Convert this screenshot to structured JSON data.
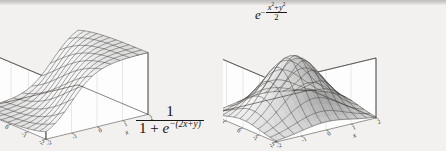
{
  "figure": {
    "background_color": "#f2f1ef",
    "ink_color": "#1b1915",
    "surface_fill_light": "#f4f4f4",
    "surface_fill_dark": "#8a8a8a",
    "mesh_color": "#3c3a37",
    "axis_color": "#35332f"
  },
  "panels": [
    {
      "id": "left",
      "name": "sigmoid-surface-plot",
      "formula_plain": "1 / (1 + e^-(2x+y))",
      "formula": {
        "numerator": "1",
        "den_one": "1",
        "den_plus": "+",
        "den_e": "e",
        "den_exp": "−(2x+y)"
      },
      "chart_data": {
        "type": "surface",
        "title": "",
        "function": "1/(1+exp(-(2x+y)))",
        "xlabel": "x",
        "ylabel": "y",
        "zlabel": "",
        "xlim": [
          -2,
          2
        ],
        "ylim": [
          -2,
          2
        ],
        "zlim": [
          0,
          1
        ],
        "xticks": [
          "-2",
          "-1",
          "0",
          "1",
          "2"
        ],
        "yticks": [
          "-2",
          "-1",
          "0",
          "1",
          "2"
        ],
        "zticks": [
          "1"
        ],
        "grid": true,
        "mesh_n": 11,
        "legend": "none",
        "description": "Logistic sigmoid ridge rising from 0 to 1 along the 2x+y direction"
      },
      "zaxis_top_label": "1",
      "xaxis_label": "x",
      "yaxis_label": "y",
      "xtick_labels": [
        "-2",
        "-1",
        "0",
        "1",
        "2"
      ],
      "ytick_labels": [
        "2",
        "1",
        "0",
        "-1",
        "-2"
      ]
    },
    {
      "id": "right",
      "name": "gaussian-surface-plot",
      "formula_plain": "e^-((x^2+y^2)/2)",
      "formula": {
        "base": "e",
        "minus": "−",
        "num_x": "x",
        "num_x_pow": "2",
        "num_plus": "+",
        "num_y": "y",
        "num_y_pow": "2",
        "den": "2"
      },
      "chart_data": {
        "type": "surface",
        "title": "",
        "function": "exp(-(x^2+y^2)/2)",
        "xlabel": "x",
        "ylabel": "y",
        "zlabel": "",
        "xlim": [
          -2,
          2
        ],
        "ylim": [
          -2,
          2
        ],
        "zlim": [
          0,
          1
        ],
        "xticks": [
          "-2",
          "-1",
          "0",
          "1",
          "2"
        ],
        "yticks": [
          "-2",
          "-1",
          "0",
          "1",
          "2"
        ],
        "zticks": [
          "1"
        ],
        "grid": true,
        "mesh_n": 11,
        "legend": "none",
        "description": "Radial Gaussian bell centred at the origin, peak value 1"
      },
      "zaxis_top_label": "1",
      "xaxis_label": "x",
      "yaxis_label": "y",
      "xtick_labels": [
        "-2",
        "-1",
        "0",
        "1",
        "2"
      ],
      "ytick_labels": [
        "2",
        "1",
        "0",
        "-1",
        "-2"
      ]
    }
  ]
}
